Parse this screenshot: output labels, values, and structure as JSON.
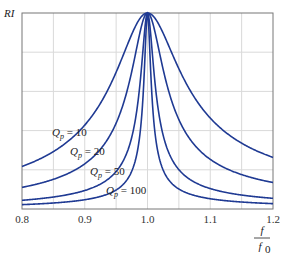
{
  "chart_data": {
    "type": "line",
    "title": "",
    "xlabel": "f / f0",
    "xlabel_num": "f",
    "xlabel_den": "f0",
    "ylabel": "RI",
    "xlim": [
      0.8,
      1.2
    ],
    "ylim": [
      0,
      1
    ],
    "grid": true,
    "legend_position": "inline labels",
    "x_ticks": [
      "0.8",
      "0.9",
      "1.0",
      "1.1",
      "1.2"
    ],
    "x": [
      0.8,
      0.85,
      0.9,
      0.95,
      1.0,
      1.05,
      1.1,
      1.15,
      1.2
    ],
    "series": [
      {
        "name": "Qp = 10",
        "Q": 10,
        "values": [
          0.217,
          0.293,
          0.428,
          0.698,
          1.0,
          0.716,
          0.464,
          0.336,
          0.263
        ]
      },
      {
        "name": "Qp = 20",
        "Q": 20,
        "values": [
          0.11,
          0.151,
          0.23,
          0.438,
          1.0,
          0.456,
          0.253,
          0.176,
          0.135
        ]
      },
      {
        "name": "Qp = 50",
        "Q": 50,
        "values": [
          0.044,
          0.061,
          0.094,
          0.191,
          1.0,
          0.2,
          0.104,
          0.071,
          0.055
        ]
      },
      {
        "name": "Qp = 100",
        "Q": 100,
        "values": [
          0.022,
          0.031,
          0.047,
          0.097,
          1.0,
          0.102,
          0.052,
          0.036,
          0.027
        ]
      }
    ],
    "annotations": [
      {
        "text_q": "Q",
        "text_sub": "p",
        "text_rest": " = 10",
        "x": 52,
        "y": 136
      },
      {
        "text_q": "Q",
        "text_sub": "p",
        "text_rest": " = 20",
        "x": 70,
        "y": 155
      },
      {
        "text_q": "Q",
        "text_sub": "p",
        "text_rest": " = 50",
        "x": 90,
        "y": 175
      },
      {
        "text_q": "Q",
        "text_sub": "p",
        "text_rest": " = 100",
        "x": 106,
        "y": 194
      }
    ],
    "colors": {
      "line": "#1f3a93",
      "grid": "#d9d9d9",
      "axis": "#777777"
    }
  }
}
